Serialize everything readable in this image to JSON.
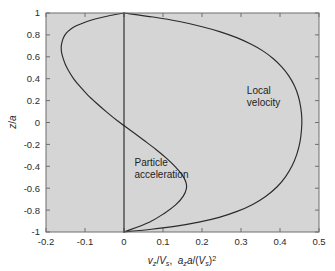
{
  "figure": {
    "background_color": "#ffffff",
    "plot_background_color": "#d5d5d5",
    "axis_color": "#6f6f6f",
    "curve_color": "#2a2a2a"
  },
  "chart_data": {
    "type": "line",
    "title": "",
    "xlabel": "vz/Vs,  aza/(Vs)^2",
    "xlabel_parts": {
      "v": "v",
      "v_sub": "z",
      "slash1": "/",
      "V": "V",
      "V_sub": "s",
      "comma": ",",
      "a": "a",
      "a_sub": "z",
      "a2": "a",
      "slash2": "/(",
      "V2": "V",
      "V2_sub": "s",
      "close": ")",
      "exp": "2"
    },
    "ylabel": "z/a",
    "ylabel_parts": {
      "z": "z",
      "slash": "/",
      "a": "a"
    },
    "xlim": [
      -0.2,
      0.5
    ],
    "ylim": [
      -1,
      1
    ],
    "xticks": [
      -0.2,
      -0.1,
      0,
      0.1,
      0.2,
      0.3,
      0.4,
      0.5
    ],
    "xticklabels": [
      "-0.2",
      "-0.1",
      "0",
      "0.1",
      "0.2",
      "0.3",
      "0.4",
      "0.5"
    ],
    "yticks": [
      -1,
      -0.8,
      -0.6,
      -0.4,
      -0.2,
      0,
      0.2,
      0.4,
      0.6,
      0.8,
      1
    ],
    "yticklabels": [
      "-1",
      "-0.8",
      "-0.6",
      "-0.4",
      "-0.2",
      "0",
      "0.2",
      "0.4",
      "0.6",
      "0.8",
      "1"
    ],
    "grid": false,
    "legend_position": "none",
    "series": [
      {
        "name": "Local velocity",
        "x": [
          0.0,
          0.075,
          0.142,
          0.198,
          0.247,
          0.289,
          0.325,
          0.357,
          0.383,
          0.405,
          0.423,
          0.437,
          0.447,
          0.453,
          0.456,
          0.455,
          0.451,
          0.443,
          0.431,
          0.414,
          0.392,
          0.364,
          0.33,
          0.29,
          0.244,
          0.192,
          0.134,
          0.07,
          0.0
        ],
        "y": [
          1.0,
          0.963,
          0.922,
          0.877,
          0.828,
          0.775,
          0.716,
          0.652,
          0.582,
          0.506,
          0.424,
          0.335,
          0.24,
          0.14,
          0.035,
          -0.073,
          -0.182,
          -0.291,
          -0.396,
          -0.496,
          -0.589,
          -0.673,
          -0.748,
          -0.812,
          -0.866,
          -0.91,
          -0.946,
          -0.975,
          -1.0
        ]
      },
      {
        "name": "Particle acceleration",
        "x": [
          0.0,
          -0.041,
          -0.074,
          -0.1,
          -0.121,
          -0.137,
          -0.148,
          -0.155,
          -0.159,
          -0.161,
          -0.16,
          -0.156,
          -0.15,
          -0.141,
          -0.129,
          -0.113,
          -0.094,
          -0.071,
          -0.045,
          -0.016,
          0.017,
          0.05,
          0.082,
          0.11,
          0.133,
          0.15,
          0.159,
          0.16,
          0.152,
          0.133,
          0.104,
          0.065,
          0.0
        ],
        "y": [
          1.0,
          0.973,
          0.945,
          0.916,
          0.885,
          0.852,
          0.816,
          0.777,
          0.735,
          0.689,
          0.639,
          0.585,
          0.527,
          0.465,
          0.399,
          0.329,
          0.255,
          0.178,
          0.097,
          0.013,
          -0.073,
          -0.16,
          -0.246,
          -0.33,
          -0.41,
          -0.483,
          -0.548,
          -0.603,
          -0.672,
          -0.75,
          -0.828,
          -0.91,
          -1.0
        ]
      },
      {
        "name": "zero-line",
        "x": [
          0.0,
          0.0
        ],
        "y": [
          1.0,
          -1.0
        ]
      }
    ],
    "annotations": [
      {
        "name": "local-velocity",
        "lines": [
          "Local",
          "velocity"
        ],
        "x": 0.315,
        "y": 0.26
      },
      {
        "name": "particle-acceleration",
        "lines": [
          "Particle",
          "acceleration"
        ],
        "x": 0.027,
        "y": -0.4
      }
    ]
  }
}
